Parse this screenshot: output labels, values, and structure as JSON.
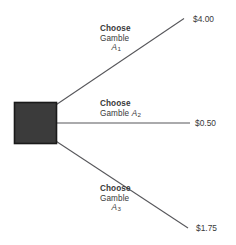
{
  "diagram": {
    "node": {
      "name": "decision-node",
      "shape": "square",
      "fill": "#3b3b3b",
      "stroke": "#1a1a1a"
    },
    "line_color": "#56565a",
    "text_color": "#39393a",
    "branches": [
      {
        "id": "a1",
        "choose_label": "Choose",
        "gamble_label": "Gamble",
        "variable": "A",
        "subscript": "1",
        "payoff": "$4.00"
      },
      {
        "id": "a2",
        "choose_label": "Choose",
        "gamble_label": "Gamble",
        "variable": "A",
        "subscript": "2",
        "payoff": "$0.50"
      },
      {
        "id": "a3",
        "choose_label": "Choose",
        "gamble_label": "Gamble",
        "variable": "A",
        "subscript": "3",
        "payoff": "$1.75"
      }
    ]
  }
}
